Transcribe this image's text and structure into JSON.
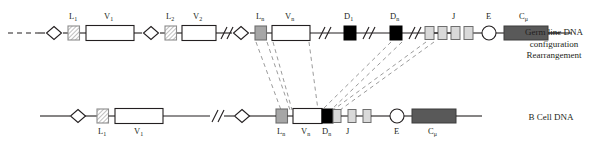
{
  "figure": {
    "type": "biology-schematic",
    "width": 600,
    "height": 149
  },
  "colors": {
    "line": "#231f20",
    "text": "#231f20",
    "leader_hatch_fill": "#ffffff",
    "leader_hatch_stroke": "#8c8c8c",
    "leader_n_fill": "#a6a6a6",
    "v_fill": "#ffffff",
    "d_fill": "#000000",
    "j_fill": "#d9d9d9",
    "e_fill": "#ffffff",
    "c_fill": "#595959",
    "dashed": "#a0a0a0"
  },
  "rows": [
    {
      "id": "germ-line",
      "name": "Germ line DNA",
      "side_label_lines": [
        "Germ line DNA",
        "configuration",
        "Rearrangement"
      ],
      "segments": [
        {
          "name": "L1",
          "label": "L",
          "sub": "1",
          "shape": "square-hatched"
        },
        {
          "name": "V1",
          "label": "V",
          "sub": "1",
          "shape": "rect-white"
        },
        {
          "name": "L2",
          "label": "L",
          "sub": "2",
          "shape": "square-hatched"
        },
        {
          "name": "V2",
          "label": "V",
          "sub": "2",
          "shape": "rect-white"
        },
        {
          "name": "Ln",
          "label": "L",
          "sub": "n",
          "shape": "square-gray"
        },
        {
          "name": "Vn",
          "label": "V",
          "sub": "n",
          "shape": "rect-white"
        },
        {
          "name": "D1",
          "label": "D",
          "sub": "1",
          "shape": "square-black"
        },
        {
          "name": "Dn",
          "label": "D",
          "sub": "n",
          "shape": "square-black"
        },
        {
          "name": "J",
          "label": "J",
          "sub": "",
          "shape": "square-lightgray",
          "count": 4
        },
        {
          "name": "E",
          "label": "E",
          "sub": "",
          "shape": "circle-white"
        },
        {
          "name": "Cmu",
          "label": "C",
          "sub": "μ",
          "shape": "rect-darkgray"
        }
      ]
    },
    {
      "id": "b-cell",
      "name": "B Cell DNA",
      "side_label_lines": [
        "B Cell DNA"
      ],
      "segments": [
        {
          "name": "L1",
          "label": "L",
          "sub": "1",
          "shape": "square-hatched"
        },
        {
          "name": "V1",
          "label": "V",
          "sub": "1",
          "shape": "rect-white"
        },
        {
          "name": "Ln",
          "label": "L",
          "sub": "n",
          "shape": "square-gray"
        },
        {
          "name": "Vn",
          "label": "V",
          "sub": "n",
          "shape": "rect-white"
        },
        {
          "name": "Dn",
          "label": "D",
          "sub": "n",
          "shape": "square-black"
        },
        {
          "name": "J",
          "label": "J",
          "sub": "",
          "shape": "square-lightgray",
          "count": 3
        },
        {
          "name": "E",
          "label": "E",
          "sub": "",
          "shape": "circle-white"
        },
        {
          "name": "Cmu",
          "label": "C",
          "sub": "μ",
          "shape": "rect-darkgray"
        }
      ]
    }
  ],
  "labels": {
    "germ_L1": "L",
    "germ_L1_sub": "1",
    "germ_V1": "V",
    "germ_V1_sub": "1",
    "germ_L2": "L",
    "germ_L2_sub": "2",
    "germ_V2": "V",
    "germ_V2_sub": "2",
    "germ_Ln": "L",
    "germ_Ln_sub": "n",
    "germ_Vn": "V",
    "germ_Vn_sub": "n",
    "germ_D1": "D",
    "germ_D1_sub": "1",
    "germ_Dn": "D",
    "germ_Dn_sub": "n",
    "germ_J": "J",
    "germ_E": "E",
    "germ_C": "C",
    "germ_C_sub": "μ",
    "bcell_L1": "L",
    "bcell_L1_sub": "1",
    "bcell_V1": "V",
    "bcell_V1_sub": "1",
    "bcell_Ln": "L",
    "bcell_Ln_sub": "n",
    "bcell_Vn": "V",
    "bcell_Vn_sub": "n",
    "bcell_Dn": "D",
    "bcell_Dn_sub": "n",
    "bcell_J": "J",
    "bcell_E": "E",
    "bcell_C": "C",
    "bcell_C_sub": "μ",
    "side_germ_1": "Germ line DNA",
    "side_germ_2": "configuration",
    "side_germ_3": "Rearrangement",
    "side_bcell": "B Cell DNA"
  }
}
